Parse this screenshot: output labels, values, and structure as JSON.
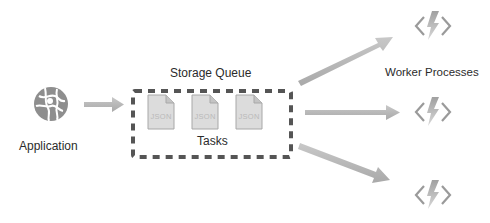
{
  "diagram": {
    "application": {
      "label": "Application",
      "icon": "globe-icon"
    },
    "queue": {
      "title": "Storage Queue",
      "caption": "Tasks",
      "messages": [
        {
          "label": "JSON"
        },
        {
          "label": "JSON"
        },
        {
          "label": "JSON"
        }
      ]
    },
    "workers": {
      "label": "Worker Processes",
      "items": [
        {
          "icon": "function-icon"
        },
        {
          "icon": "function-icon"
        },
        {
          "icon": "function-icon"
        }
      ]
    },
    "colors": {
      "arrow": "#b5b5b5",
      "icon": "#9a9a9a",
      "doc_fill": "#dcdcdc",
      "doc_stroke": "#a8a8a8",
      "queue_border": "#555555"
    }
  }
}
